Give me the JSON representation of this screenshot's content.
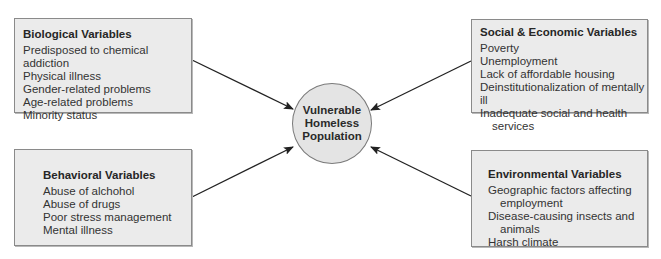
{
  "diagram": {
    "center": {
      "lines": [
        "Vulnerable",
        "Homeless",
        "Population"
      ]
    },
    "boxes": [
      {
        "title": "Biological Variables",
        "items": [
          "Predisposed to chemical addiction",
          "Physical illness",
          "Gender-related problems",
          "Age-related problems",
          "Minority status"
        ]
      },
      {
        "title": "Social & Economic Variables",
        "items": [
          "Poverty",
          "Unemployment",
          "Lack of affordable housing",
          "Deinstitutionalization of mentally ill",
          "Inadequate social and health services"
        ]
      },
      {
        "title": "Behavioral Variables",
        "items": [
          "Abuse of alchohol",
          "Abuse of drugs",
          "Poor stress management",
          "Mental illness"
        ]
      },
      {
        "title": "Environmental Variables",
        "items": [
          "Geographic factors affecting employment",
          "Disease-causing insects and animals",
          "Harsh climate"
        ]
      }
    ],
    "colors": {
      "box_fill": "#ebebeb",
      "circle_fill": "#e4e4e4",
      "stroke": "#222222"
    }
  }
}
